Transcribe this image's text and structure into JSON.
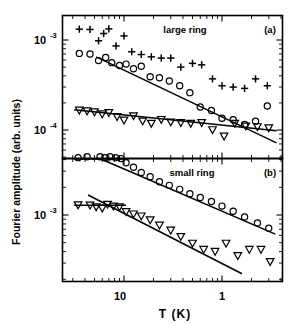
{
  "figure": {
    "ylabel": "Fourier amplitude (arb. units)",
    "xlabel": "T  (K)",
    "panels": [
      {
        "id": "a",
        "title": "large ring",
        "tag": "(a)"
      },
      {
        "id": "b",
        "title": "small ring",
        "tag": "(b)"
      }
    ],
    "y_ticks_a": [
      {
        "mantissa": "10",
        "exponent": "-3"
      },
      {
        "mantissa": "10",
        "exponent": "-4"
      }
    ],
    "y_ticks_b": [
      {
        "mantissa": "10",
        "exponent": "-3"
      }
    ],
    "x_ticks": [
      {
        "mantissa": "10",
        "exponent": "-1"
      },
      {
        "mantissa": "1",
        "exponent": ""
      }
    ],
    "line_color": "#000000"
  },
  "chart_data": [
    {
      "type": "scatter",
      "panel": "a",
      "title": "large ring",
      "tag": "(a)",
      "xlabel": "T  (K)",
      "ylabel": "Fourier amplitude (arb. units)",
      "xscale": "log",
      "yscale": "log",
      "xlim": [
        0.03,
        4.0
      ],
      "ylim": [
        6e-05,
        0.0022
      ],
      "grid": false,
      "legend": "none",
      "series": [
        {
          "name": "plus-series",
          "marker": "plus",
          "x": [
            0.035,
            0.045,
            0.055,
            0.062,
            0.07,
            0.083,
            0.1,
            0.12,
            0.15,
            0.19,
            0.24,
            0.3,
            0.38,
            0.5,
            0.62,
            0.8,
            1.0,
            1.3,
            1.7,
            2.2,
            2.9
          ],
          "y": [
            0.00132,
            0.00131,
            0.00098,
            0.00118,
            0.00133,
            0.00086,
            0.00111,
            0.00074,
            0.00069,
            0.00065,
            0.00063,
            0.00063,
            0.0005,
            0.00055,
            0.00053,
            0.00037,
            0.00031,
            0.0003,
            0.00029,
            0.00037,
            0.00031
          ]
        },
        {
          "name": "circle-series",
          "marker": "circle",
          "x": [
            0.035,
            0.045,
            0.055,
            0.065,
            0.075,
            0.09,
            0.105,
            0.125,
            0.15,
            0.185,
            0.23,
            0.29,
            0.37,
            0.47,
            0.6,
            0.78,
            1.0,
            1.3,
            1.7,
            2.2,
            2.9
          ],
          "y": [
            0.00071,
            0.0007,
            0.00059,
            0.00064,
            0.00056,
            0.00052,
            0.00054,
            0.00048,
            0.00051,
            0.00039,
            0.00038,
            0.00035,
            0.00031,
            0.00026,
            0.00018,
            0.000165,
            0.000135,
            0.00013,
            0.000115,
            0.000125,
            0.000185
          ]
        },
        {
          "name": "triangle-series",
          "marker": "triangle-down",
          "x": [
            0.035,
            0.042,
            0.05,
            0.06,
            0.07,
            0.085,
            0.1,
            0.125,
            0.155,
            0.19,
            0.24,
            0.3,
            0.38,
            0.48,
            0.62,
            0.8,
            1.05,
            1.35,
            1.75,
            2.3,
            3.0
          ],
          "y": [
            0.000165,
            0.000162,
            0.000158,
            0.00015,
            0.000155,
            0.00014,
            0.000128,
            0.000143,
            0.000125,
            0.000118,
            0.00013,
            0.000122,
            0.00012,
            0.000118,
            0.00012,
            0.0001,
            8.5e-05,
            0.000118,
            0.00011,
            0.000108,
            0.000105
          ]
        }
      ],
      "fits": [
        {
          "name": "circle-fit",
          "x": [
            0.052,
            3.6
          ],
          "y": [
            0.00065,
            7.2e-05
          ]
        },
        {
          "name": "triangle-fit",
          "x": [
            0.031,
            3.6
          ],
          "y": [
            0.000168,
            9.8e-05
          ]
        }
      ]
    },
    {
      "type": "scatter",
      "panel": "b",
      "title": "small ring",
      "tag": "(b)",
      "xlabel": "T  (K)",
      "ylabel": "Fourier amplitude (arb. units)",
      "xscale": "log",
      "yscale": "log",
      "xlim": [
        0.03,
        4.0
      ],
      "ylim": [
        0.00022,
        0.0062
      ],
      "grid": false,
      "legend": "none",
      "series": [
        {
          "name": "circle-series",
          "marker": "circle",
          "x": [
            0.034,
            0.042,
            0.05,
            0.057,
            0.064,
            0.072,
            0.082,
            0.093,
            0.105,
            0.125,
            0.15,
            0.185,
            0.23,
            0.29,
            0.37,
            0.47,
            0.6,
            0.78,
            1.0,
            1.3,
            1.7,
            2.3,
            3.0
          ],
          "y": [
            0.0042,
            0.0043,
            0.0044,
            0.0043,
            0.0042,
            0.0043,
            0.0042,
            0.0041,
            0.0037,
            0.0033,
            0.0029,
            0.0026,
            0.0023,
            0.0021,
            0.0019,
            0.0017,
            0.00155,
            0.0014,
            0.00125,
            0.0011,
            0.00095,
            0.00082,
            0.00072
          ]
        },
        {
          "name": "triangle-series",
          "marker": "triangle-down",
          "x": [
            0.034,
            0.045,
            0.052,
            0.06,
            0.068,
            0.078,
            0.09,
            0.105,
            0.125,
            0.15,
            0.185,
            0.23,
            0.3,
            0.38,
            0.5,
            0.65,
            0.85,
            1.1,
            1.45,
            1.9,
            2.5,
            3.1
          ],
          "y": [
            0.00128,
            0.00127,
            0.00122,
            0.00118,
            0.0013,
            0.00124,
            0.00122,
            0.00108,
            0.00102,
            0.00097,
            0.00088,
            0.00077,
            0.00068,
            0.00058,
            0.00049,
            0.00042,
            0.0004,
            0.00049,
            0.00036,
            0.00042,
            0.00042,
            0.00031
          ]
        }
      ],
      "fits": [
        {
          "name": "circle-plateau",
          "x": [
            0.031,
            0.112
          ],
          "y": [
            0.0043,
            0.0043
          ]
        },
        {
          "name": "circle-decay",
          "x": [
            0.058,
            3.5
          ],
          "y": [
            0.0062,
            0.00062
          ]
        },
        {
          "name": "triangle-plateau",
          "x": [
            0.031,
            0.105
          ],
          "y": [
            0.00128,
            0.00128
          ]
        },
        {
          "name": "triangle-decay",
          "x": [
            0.043,
            1.6
          ],
          "y": [
            0.00165,
            0.00023
          ]
        }
      ]
    }
  ]
}
